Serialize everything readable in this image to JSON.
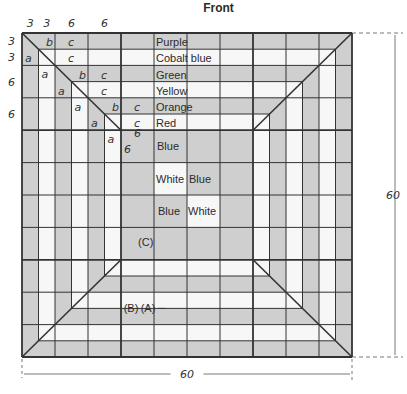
{
  "title": "Front",
  "colors": {
    "gray": "#cfcfcf",
    "white": "#f7f7f7",
    "line": "#333333"
  },
  "diagram": {
    "total_size": 60,
    "ring_width": 3,
    "center_cell": 6,
    "strips": [
      {
        "name": "Purple",
        "tone": "gray"
      },
      {
        "name": "Cobalt blue",
        "tone": "white"
      },
      {
        "name": "Green",
        "tone": "gray"
      },
      {
        "name": "Yellow",
        "tone": "white"
      },
      {
        "name": "Orange",
        "tone": "gray"
      },
      {
        "name": "Red",
        "tone": "white"
      }
    ],
    "center_label": "Blue",
    "center_grid": [
      [
        "Blue",
        "Blue",
        "Blue",
        "Blue"
      ],
      [
        "Blue",
        "White",
        "Blue",
        "Blue"
      ],
      [
        "Blue",
        "Blue",
        "White",
        "Blue"
      ],
      [
        "Blue",
        "Blue",
        "Blue",
        "Blue"
      ]
    ],
    "center_texts": [
      "White",
      "Blue",
      "Blue",
      "White"
    ],
    "part_labels": [
      "(A)",
      "(B)",
      "(C)"
    ],
    "corner_letters": [
      "a",
      "b",
      "c"
    ],
    "dimensions": {
      "top": [
        "3",
        "3",
        "6",
        "6"
      ],
      "left": [
        "3",
        "3",
        "6",
        "6"
      ],
      "corner": [
        "6",
        "6"
      ],
      "width": "60",
      "height": "60"
    }
  }
}
